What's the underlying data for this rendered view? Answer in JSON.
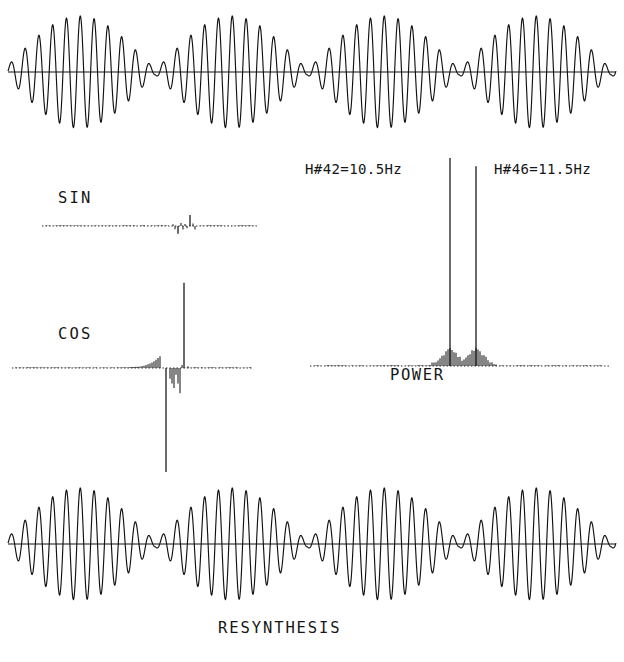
{
  "figure": {
    "background_color": "#ffffff",
    "ink_color": "#111111"
  },
  "labels": {
    "sin": "SIN",
    "cos": "COS",
    "power": "POWER",
    "resynthesis": "RESYNTHESIS",
    "harmonic_left": "H#42=10.5Hz",
    "harmonic_right": "H#46=11.5Hz"
  },
  "annotations": {
    "harmonic_left_number": 42,
    "harmonic_left_frequency_hz": 10.5,
    "harmonic_right_number": 46,
    "harmonic_right_frequency_hz": 11.5
  },
  "chart_data": [
    {
      "type": "line",
      "name": "original-waveform",
      "title": "",
      "xlabel": "",
      "ylabel": "",
      "description": "Amplitude-modulated beat waveform: sum of two sinusoids at 10.5 Hz and 11.5 Hz producing 1 Hz beating with 4 complete beat envelopes.",
      "carrier_frequency_hz": 11.0,
      "beat_frequency_hz": 1.0,
      "beat_count": 4,
      "cycles_total": 44,
      "amplitude": 1.0,
      "grid": false,
      "x": [
        0,
        4
      ],
      "ylim": [
        -1.05,
        1.05
      ]
    },
    {
      "type": "line",
      "name": "sin-spectrum",
      "title": "SIN",
      "xlabel": "",
      "ylabel": "",
      "description": "Sine (imaginary) Fourier coefficients; near zero across the band with a small negative spike at harmonic 42 and a small positive spike at harmonic 46.",
      "grid": false,
      "baseline": 0,
      "ylim": [
        -0.45,
        0.45
      ],
      "harmonics": [
        42,
        46
      ],
      "values": [
        -0.3,
        0.42
      ]
    },
    {
      "type": "line",
      "name": "cos-spectrum",
      "title": "COS",
      "xlabel": "",
      "ylabel": "",
      "description": "Cosine (real) Fourier coefficients; large negative spike at harmonic 42 and large positive spike at harmonic 46 with small sidelobe ripple between.",
      "grid": false,
      "baseline": 0,
      "ylim": [
        -1.0,
        1.0
      ],
      "harmonics": [
        42,
        46
      ],
      "values": [
        -1.0,
        0.82
      ]
    },
    {
      "type": "bar",
      "name": "power-spectrum",
      "title": "POWER",
      "xlabel": "",
      "ylabel": "",
      "description": "Power spectrum with two dominant peaks at harmonics 42 (10.5 Hz) and 46 (11.5 Hz) of nearly equal magnitude, plus low sidelobes nearby.",
      "grid": false,
      "categories": [
        42,
        46
      ],
      "values": [
        1.0,
        0.96
      ],
      "ylim": [
        0,
        1.05
      ],
      "peak_labels": [
        "H#42=10.5Hz",
        "H#46=11.5Hz"
      ]
    },
    {
      "type": "line",
      "name": "resynthesis-waveform",
      "title": "RESYNTHESIS",
      "xlabel": "",
      "ylabel": "",
      "description": "Waveform resynthesized from the SIN and COS Fourier coefficients; visually identical to the original beating waveform.",
      "carrier_frequency_hz": 11.0,
      "beat_frequency_hz": 1.0,
      "beat_count": 4,
      "cycles_total": 44,
      "amplitude": 1.0,
      "grid": false,
      "x": [
        0,
        4
      ],
      "ylim": [
        -1.05,
        1.05
      ]
    }
  ]
}
